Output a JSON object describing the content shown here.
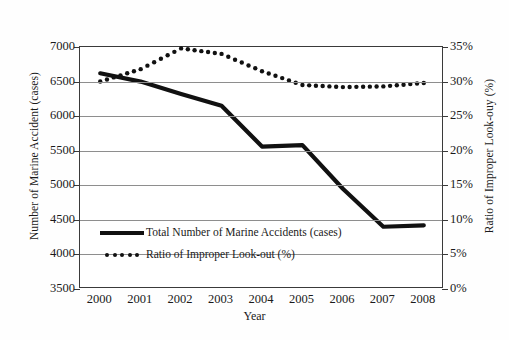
{
  "chart_data": {
    "type": "line",
    "title": "",
    "xlabel": "Year",
    "ylabel": "Number of Marine Accident (cases)",
    "y2label": "Ratio of Improper Look-ouy (%)",
    "categories": [
      "2000",
      "2001",
      "2002",
      "2003",
      "2004",
      "2005",
      "2006",
      "2007",
      "2008"
    ],
    "ylim": [
      3500,
      7000
    ],
    "y2lim": [
      0,
      35
    ],
    "yticks": [
      "3500",
      "4000",
      "4500",
      "5000",
      "5500",
      "6000",
      "6500",
      "7000"
    ],
    "y2ticks": [
      "0%",
      "5%",
      "10%",
      "15%",
      "20%",
      "25%",
      "30%",
      "35%"
    ],
    "grid": true,
    "legend_position": "inside-bottom-left",
    "series": [
      {
        "name": "Total Number of Marine Accidents (cases)",
        "axis": "left",
        "style": "solid",
        "color": "#111111",
        "values": [
          6620,
          6500,
          6320,
          6150,
          5560,
          5580,
          4950,
          4400,
          4420
        ]
      },
      {
        "name": "Ratio of Improper Look-out (%)",
        "axis": "right",
        "style": "dotted",
        "color": "#111111",
        "values": [
          30.0,
          31.8,
          34.8,
          34.0,
          31.5,
          29.5,
          29.2,
          29.3,
          29.8
        ]
      }
    ]
  },
  "legend": {
    "items": [
      {
        "label": "Total Number of Marine Accidents (cases)",
        "marker": "solid-line-swatch"
      },
      {
        "label": "Ratio of Improper Look-out (%)",
        "marker": "dotted-line-swatch"
      }
    ]
  }
}
